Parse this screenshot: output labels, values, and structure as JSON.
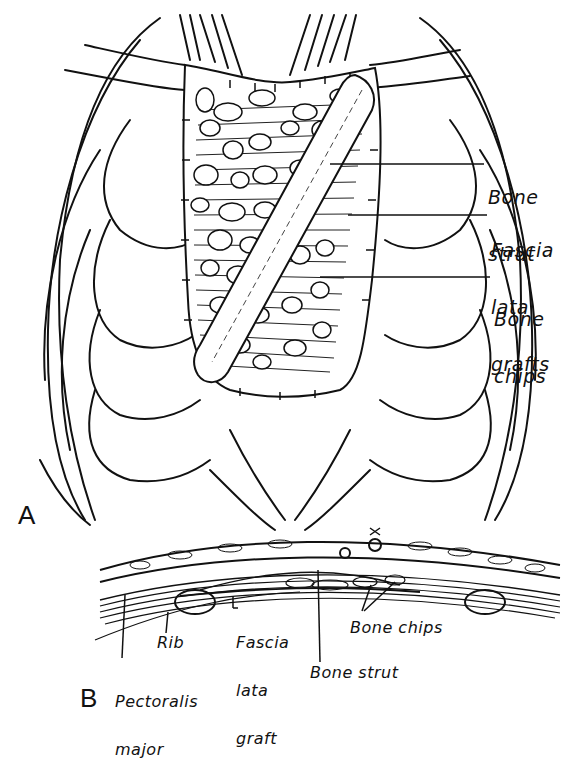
{
  "figure": {
    "panel_a": {
      "letter": "A",
      "labels": {
        "bone_strut": [
          "Bone",
          "strut"
        ],
        "fascia_lata_grafts": [
          "Fascia",
          "lata",
          "grafts"
        ],
        "bone_chips": [
          "Bone",
          "chips"
        ]
      }
    },
    "panel_b": {
      "letter": "B",
      "labels": {
        "rib": "Rib",
        "pectoralis_major": [
          "Pectoralis",
          "major"
        ],
        "fascia_lata_graft": [
          "Fascia",
          "lata",
          "graft"
        ],
        "bone_chips": "Bone chips",
        "bone_strut": "Bone strut"
      }
    },
    "colors": {
      "ink": "#111111",
      "paper": "#ffffff"
    }
  }
}
